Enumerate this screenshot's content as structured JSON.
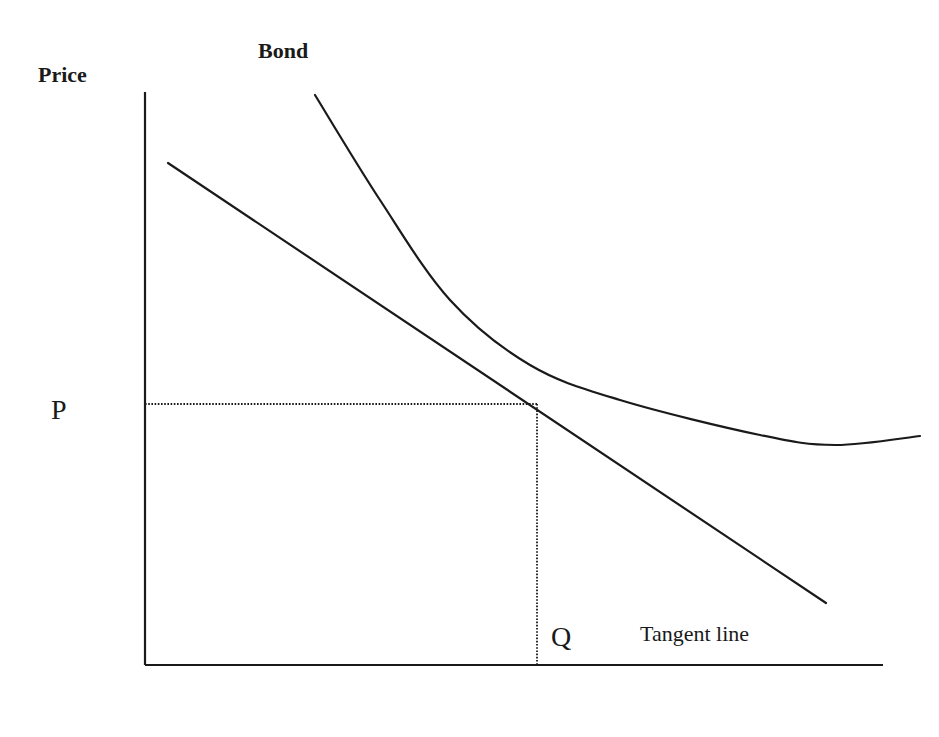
{
  "diagram": {
    "title": "Bond",
    "y_axis_label": "Price",
    "price_marker": "P",
    "quantity_marker": "Q",
    "tangent_label": "Tangent line",
    "colors": {
      "ink": "#1a1a1a",
      "background": "#ffffff"
    }
  },
  "chart_data": {
    "type": "line",
    "title": "Bond",
    "ylabel": "Price",
    "xlabel": "",
    "series": [
      {
        "name": "Bond price curve",
        "points": [
          [
            315,
            95
          ],
          [
            380,
            200
          ],
          [
            450,
            300
          ],
          [
            530,
            365
          ],
          [
            620,
            400
          ],
          [
            760,
            435
          ],
          [
            835,
            445
          ],
          [
            920,
            436
          ]
        ]
      },
      {
        "name": "Tangent line",
        "points": [
          [
            168,
            163
          ],
          [
            826,
            603
          ]
        ]
      }
    ],
    "axes": {
      "y_axis": {
        "x": 145,
        "y_top": 92,
        "y_bottom": 665
      },
      "x_axis": {
        "y": 665,
        "x_left": 145,
        "x_right": 883
      }
    },
    "annotations": [
      {
        "label": "P",
        "type": "dotted-horizontal",
        "y": 404,
        "x_from": 145,
        "x_to": 537
      },
      {
        "label": "Q",
        "type": "dotted-vertical",
        "x": 537,
        "y_from": 404,
        "y_to": 665
      }
    ],
    "tangent_point": [
      537,
      404
    ]
  }
}
